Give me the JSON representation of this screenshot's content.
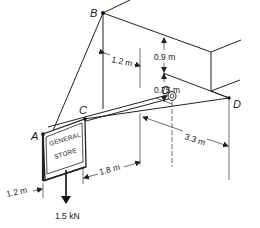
{
  "diagram": {
    "type": "3D statics figure",
    "points": {
      "A": "A",
      "B": "B",
      "C": "C",
      "D": "D",
      "O": "O"
    },
    "sign_text": {
      "line1": "GENERAL",
      "line2": "STORE"
    },
    "dimensions": {
      "b_offset": "1.2 m",
      "upper_vertical": "0.9 m",
      "lower_vertical": "0.75 m",
      "od_length": "3.3 m",
      "oc_length": "1.8 m",
      "sign_width": "1.2 m"
    },
    "load": {
      "label": "1.5 kN",
      "direction": "down"
    },
    "colors": {
      "line": "#222222",
      "background": "#ffffff"
    }
  }
}
